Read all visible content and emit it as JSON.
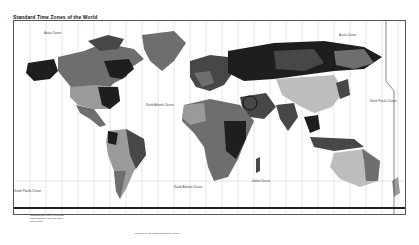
{
  "map": {
    "title": "Standard Time Zones of the World",
    "ocean_labels": [
      {
        "text": "Arctic Ocean",
        "x": 40,
        "y": 17
      },
      {
        "text": "Arctic Ocean",
        "x": 330,
        "y": 17
      },
      {
        "text": "North Atlantic Ocean",
        "x": 120,
        "y": 80
      },
      {
        "text": "North Pacific Ocean",
        "x": 355,
        "y": 78
      },
      {
        "text": "South Pacific Ocean",
        "x": 10,
        "y": 165
      },
      {
        "text": "South Atlantic Ocean",
        "x": 170,
        "y": 165
      },
      {
        "text": "Indian Ocean",
        "x": 240,
        "y": 160
      }
    ],
    "legend": {
      "lines": [
        "Standard time zone: even hour",
        "Standard time zone: half hour",
        "Time zones"
      ]
    },
    "credit": "Prepared by the Central Intelligence Agency",
    "colors": {
      "darkest": "#1e1e1e",
      "dark": "#474747",
      "mid": "#6e6e6e",
      "light": "#9a9a9a",
      "lighter": "#bdbdbd",
      "lightest": "#d8d8d8",
      "gridline": "#c8c8c8"
    }
  }
}
